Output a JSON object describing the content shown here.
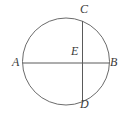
{
  "figure": {
    "background_color": "#ffffff",
    "stroke_color": "#5a5a5a",
    "label_color": "#3a3a3a",
    "circle": {
      "center_x": 66,
      "center_y": 61.5,
      "radius": 43.5,
      "stroke_width": 0.9
    },
    "segments": [
      {
        "name": "segment-AB",
        "from": "A",
        "to": "B",
        "x1": 22.5,
        "y1": 63,
        "x2": 109.5,
        "y2": 63,
        "stroke_width": 1.0
      },
      {
        "name": "segment-CD",
        "from": "C",
        "to": "D",
        "x1": 82.5,
        "y1": 21,
        "x2": 82.5,
        "y2": 101,
        "stroke_width": 1.0
      }
    ],
    "points": [
      {
        "id": "A",
        "label": "A",
        "x": 22.5,
        "y": 63,
        "label_x": 12,
        "label_y": 56
      },
      {
        "id": "B",
        "label": "B",
        "x": 109.5,
        "y": 63,
        "label_x": 110,
        "label_y": 56
      },
      {
        "id": "C",
        "label": "C",
        "x": 82.5,
        "y": 21,
        "label_x": 80,
        "label_y": 3
      },
      {
        "id": "D",
        "label": "D",
        "x": 82.5,
        "y": 101,
        "label_x": 80,
        "label_y": 98
      },
      {
        "id": "E",
        "label": "E",
        "x": 82.5,
        "y": 63,
        "label_x": 71,
        "label_y": 45
      }
    ]
  }
}
